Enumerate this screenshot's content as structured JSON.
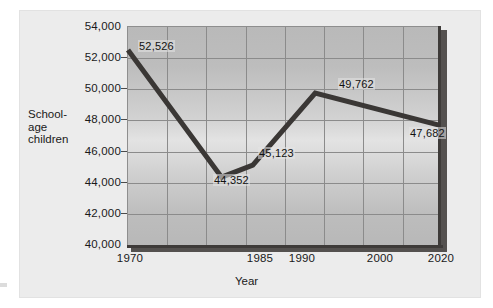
{
  "chart_data": {
    "type": "line",
    "title": "",
    "xlabel": "Year",
    "ylabel": "School-age children",
    "ylabel_lines": [
      "School-",
      "age",
      "children"
    ],
    "categories": [
      "1970",
      "1985",
      "1990",
      "2000",
      "2020"
    ],
    "x": [
      1970,
      1985,
      1990,
      2000,
      2020
    ],
    "values": [
      52526,
      44352,
      45123,
      49762,
      47682
    ],
    "point_labels": [
      "52,526",
      "44,352",
      "45,123",
      "49,762",
      "47,682"
    ],
    "ylim": [
      40000,
      54000
    ],
    "xlim": [
      1970,
      2020
    ],
    "ytick_labels": [
      "54,000",
      "52,000",
      "50,000",
      "48,000",
      "46,000",
      "44,000",
      "42,000",
      "40,000"
    ],
    "ytick_values": [
      54000,
      52000,
      50000,
      48000,
      46000,
      44000,
      42000,
      40000
    ],
    "xtick_labels": [
      "1970",
      "1985",
      "1990",
      "2000",
      "2020"
    ],
    "grid": true,
    "legend": "none",
    "series": [
      {
        "name": "School-age children",
        "values": [
          52526,
          44352,
          45123,
          49762,
          47682
        ]
      }
    ],
    "colors": {
      "line": "#3a3735",
      "plot_fill": "#c6c6c6",
      "gridline": "#8b8b8b",
      "axis_dark": "#3e3b39",
      "panel_background": "#ececec",
      "text": "#1a1a1a"
    }
  }
}
